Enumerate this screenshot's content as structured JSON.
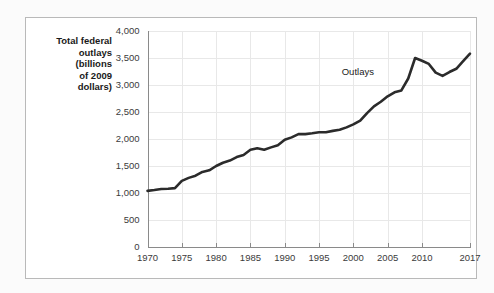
{
  "figure": {
    "axis_caption_lines": [
      "Total federal",
      "outlays",
      "(billions",
      "of 2009",
      "dollars)"
    ],
    "frame_color": "#b9b9b9",
    "background_color": "#ffffff"
  },
  "chart_data": {
    "type": "line",
    "title": "",
    "subtitle": "",
    "xlabel": "",
    "ylabel": "Total federal outlays (billions of 2009 dollars)",
    "xlim": [
      1970,
      2017
    ],
    "ylim": [
      0,
      4000
    ],
    "grid": true,
    "legend_position": "inline-annotation",
    "line_color": "#2b2b2b",
    "y_ticks": [
      0,
      500,
      1000,
      1500,
      2000,
      2500,
      3000,
      3500,
      4000
    ],
    "y_tick_labels": [
      "0",
      "500",
      "1,000",
      "1,500",
      "2,000",
      "2,500",
      "3,000",
      "3,500",
      "4,000"
    ],
    "x_ticks": [
      1970,
      1975,
      1980,
      1985,
      1990,
      1995,
      2000,
      2005,
      2010,
      2017
    ],
    "x_tick_labels": [
      "1970",
      "1975",
      "1980",
      "1985",
      "1990",
      "1995",
      "2000",
      "2005",
      "2010",
      "2017"
    ],
    "annotations": [
      {
        "text": "Outlays",
        "x": 2003,
        "y": 3180
      }
    ],
    "series": [
      {
        "name": "Outlays",
        "x": [
          1970,
          1971,
          1972,
          1973,
          1974,
          1975,
          1976,
          1977,
          1978,
          1979,
          1980,
          1981,
          1982,
          1983,
          1984,
          1985,
          1986,
          1987,
          1988,
          1989,
          1990,
          1991,
          1992,
          1993,
          1994,
          1995,
          1996,
          1997,
          1998,
          1999,
          2000,
          2001,
          2002,
          2003,
          2004,
          2005,
          2006,
          2007,
          2008,
          2009,
          2010,
          2011,
          2012,
          2013,
          2014,
          2015,
          2016,
          2017
        ],
        "values": [
          1040,
          1055,
          1075,
          1080,
          1090,
          1225,
          1280,
          1320,
          1390,
          1420,
          1500,
          1560,
          1600,
          1665,
          1705,
          1800,
          1830,
          1800,
          1845,
          1885,
          1985,
          2030,
          2090,
          2090,
          2105,
          2125,
          2125,
          2150,
          2170,
          2215,
          2270,
          2340,
          2480,
          2605,
          2690,
          2790,
          2865,
          2900,
          3120,
          3500,
          3450,
          3390,
          3230,
          3170,
          3240,
          3300,
          3440,
          3580
        ]
      }
    ]
  }
}
